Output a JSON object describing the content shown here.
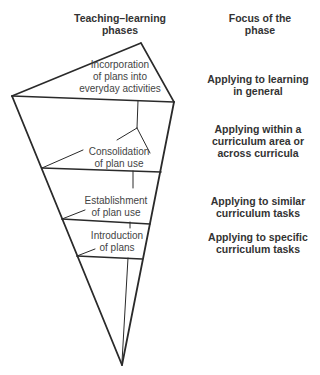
{
  "headers": {
    "left": [
      "Teaching–learning",
      "phases"
    ],
    "right": [
      "Focus of the",
      "phase"
    ]
  },
  "phases": [
    {
      "lines": [
        "Incorporation",
        "of plans into",
        "everyday activities"
      ]
    },
    {
      "lines": [
        "Consolidation",
        "of plan use"
      ]
    },
    {
      "lines": [
        "Establishment",
        "of plan use"
      ]
    },
    {
      "lines": [
        "Introduction",
        "of plans"
      ]
    }
  ],
  "focus": [
    {
      "lines": [
        "Applying to learning",
        "in general"
      ]
    },
    {
      "lines": [
        "Applying within a",
        "curriculum area or",
        "across curricula"
      ]
    },
    {
      "lines": [
        "Applying to similar",
        "curriculum tasks"
      ]
    },
    {
      "lines": [
        "Applying to specific",
        "curriculum tasks"
      ]
    }
  ],
  "colors": {
    "line": "#2a2a2a",
    "text": "#333333"
  }
}
